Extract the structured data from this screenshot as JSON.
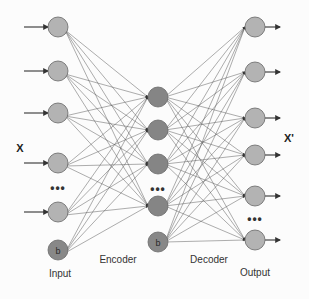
{
  "diagram": {
    "labels": {
      "input_vector": "X",
      "output_vector": "X'",
      "input_layer": "Input",
      "encoder": "Encoder",
      "decoder": "Decoder",
      "output_layer": "Output",
      "bias": "b",
      "ellipsis": "•••"
    },
    "colors": {
      "io_node": "#b3b3b3",
      "hidden_node": "#858585",
      "bias_node": "#888888",
      "edge": "#555555",
      "node_stroke": "#666666"
    },
    "layers": {
      "input": {
        "x": 58,
        "r": 10,
        "nodes_y": [
          27,
          71,
          113,
          163,
          212
        ],
        "bias_y": 250
      },
      "hidden": {
        "x": 158,
        "r": 10,
        "nodes_y": [
          97,
          130,
          164,
          206
        ],
        "bias_y": 242
      },
      "output": {
        "x": 255,
        "r": 10,
        "nodes_y": [
          27,
          72,
          118,
          155,
          196,
          240
        ]
      }
    }
  }
}
